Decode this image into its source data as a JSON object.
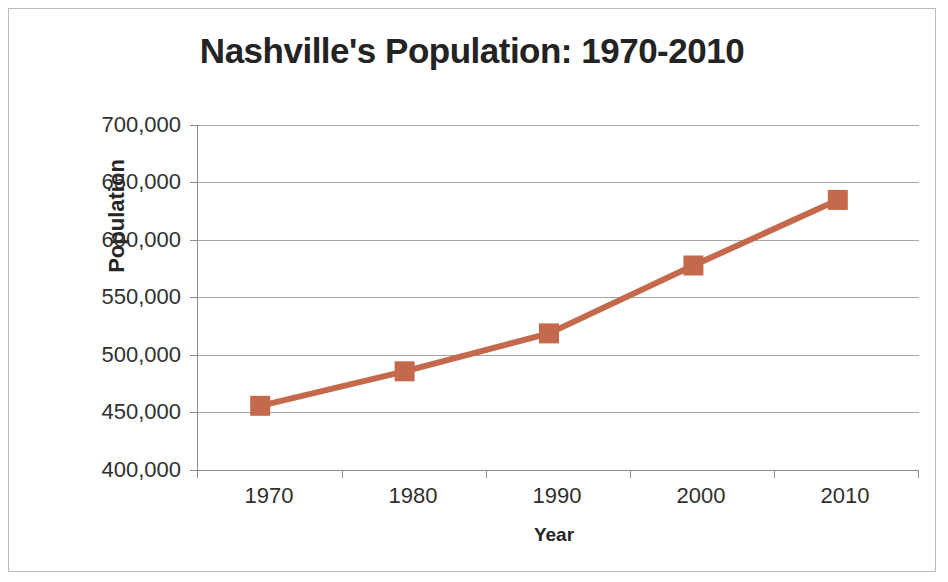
{
  "chart_data": {
    "type": "line",
    "title": "Nashville's Population: 1970-2010",
    "xlabel": "Year",
    "ylabel": "Population",
    "categories": [
      "1970",
      "1980",
      "1990",
      "2000",
      "2010"
    ],
    "x": [
      1970,
      1980,
      1990,
      2000,
      2010
    ],
    "values": [
      448000,
      478000,
      511000,
      570000,
      627000
    ],
    "series": [
      {
        "name": "Population",
        "values": [
          448000,
          478000,
          511000,
          570000,
          627000
        ],
        "color": "#C4694B",
        "marker": "square"
      }
    ],
    "ylim": [
      400000,
      700000
    ],
    "ytick_step": 50000,
    "ytick_labels": [
      "700,000",
      "650,000",
      "600,000",
      "550,000",
      "500,000",
      "450,000",
      "400,000"
    ],
    "ytick_values": [
      700000,
      650000,
      600000,
      550000,
      500000,
      450000,
      400000
    ],
    "xtick_labels": [
      "1970",
      "1980",
      "1990",
      "2000",
      "2010"
    ],
    "grid": "horizontal",
    "legend": "none",
    "line_color": "#C4694B",
    "marker_color": "#C4694B",
    "gridline_color": "#A6A6A6",
    "axis_color": "#8C8C8C",
    "text_color": "#303030",
    "title_color": "#232323",
    "background": "#FFFFFF",
    "border_color": "#B9B9B9"
  }
}
